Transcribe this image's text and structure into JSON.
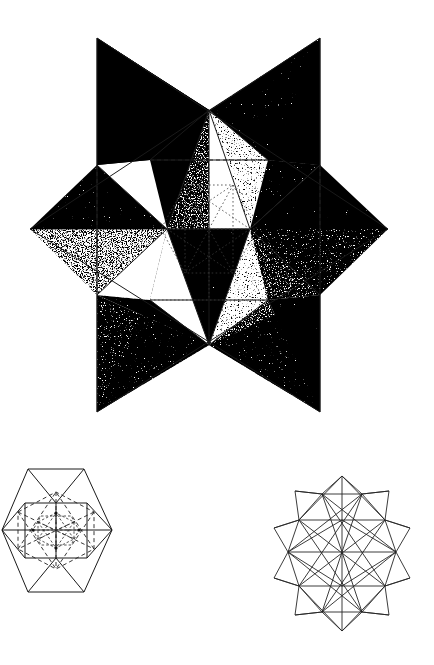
{
  "page": {
    "background_color": "#ffffff",
    "ink_color": "#1a1a1a",
    "width": 434,
    "height": 665,
    "technique": "pen-and-ink stipple shading with ruled construction lines"
  },
  "figures": [
    {
      "id": "fig-main",
      "name": "main-stellated-star",
      "caption": "",
      "description": "Large six-pointed stellated polyhedron rendered in stipple shading",
      "bounds": {
        "x": 0,
        "y": 0,
        "width": 434,
        "height": 440
      },
      "outer_points": [
        {
          "label": "top-left-spike",
          "x": 97,
          "y": 38
        },
        {
          "label": "top-right-spike",
          "x": 320,
          "y": 38
        },
        {
          "label": "right-point",
          "x": 388,
          "y": 229
        },
        {
          "label": "bottom-right-spike",
          "x": 320,
          "y": 412
        },
        {
          "label": "bottom-left-spike",
          "x": 97,
          "y": 412
        },
        {
          "label": "left-point",
          "x": 30,
          "y": 229
        }
      ],
      "inner_vertices": [
        {
          "label": "top-center",
          "x": 209,
          "y": 110
        },
        {
          "label": "left-inner",
          "x": 167,
          "y": 229
        },
        {
          "label": "right-inner",
          "x": 250,
          "y": 229
        },
        {
          "label": "bottom-center",
          "x": 209,
          "y": 345
        },
        {
          "label": "upper-right-inner",
          "x": 268,
          "y": 160
        },
        {
          "label": "upper-left-inner",
          "x": 150,
          "y": 160
        }
      ],
      "shading_tones": [
        {
          "region": "upper-left-face",
          "tone": "light",
          "density": 0.16
        },
        {
          "region": "upper-right-face",
          "tone": "light",
          "density": 0.18
        },
        {
          "region": "upper-center-dark",
          "tone": "very-dark",
          "density": 0.62
        },
        {
          "region": "right-upper-mid",
          "tone": "medium-dark",
          "density": 0.46
        },
        {
          "region": "left-wing-upper",
          "tone": "light",
          "density": 0.17
        },
        {
          "region": "left-wing-lower",
          "tone": "dark",
          "density": 0.52
        },
        {
          "region": "right-wing-upper",
          "tone": "light",
          "density": 0.15
        },
        {
          "region": "right-wing-lower",
          "tone": "medium",
          "density": 0.35
        },
        {
          "region": "center-lower-left",
          "tone": "very-light",
          "density": 0.08
        },
        {
          "region": "center-right-dark",
          "tone": "very-dark",
          "density": 0.66
        },
        {
          "region": "bottom-left-spike-face",
          "tone": "medium",
          "density": 0.4
        },
        {
          "region": "bottom-right-spike-face",
          "tone": "medium-dark",
          "density": 0.45
        },
        {
          "region": "left-void",
          "tone": "white",
          "density": 0.0
        },
        {
          "region": "lower-void",
          "tone": "white",
          "density": 0.0
        }
      ],
      "construction_lines": {
        "vertical_guides": 2,
        "dashed_guides": 4,
        "dotted_interior_hexagon": true
      }
    },
    {
      "id": "fig-hex",
      "name": "hexagonal-projection-diagram",
      "caption": "",
      "description": "Hexagonal outline with nested dashed construction polygons showing the core icosahedron",
      "bounds": {
        "x": 0,
        "y": 440,
        "width": 217,
        "height": 225
      },
      "outer_hexagon": [
        {
          "x": 84,
          "y": 469
        },
        {
          "x": 131,
          "y": 469
        },
        {
          "x": 158,
          "y": 530
        },
        {
          "x": 131,
          "y": 593
        },
        {
          "x": 84,
          "y": 593
        },
        {
          "x": 57,
          "y": 530
        }
      ],
      "line_styles": [
        "solid",
        "dashed",
        "dotted"
      ],
      "nested_levels": 3,
      "has_center_node": true
    },
    {
      "id": "fig-star",
      "name": "small-stellated-polyhedron",
      "caption": "",
      "description": "Small wireframe stellated icosahedron in outline only",
      "bounds": {
        "x": 250,
        "y": 460,
        "width": 184,
        "height": 185
      },
      "spike_count": 12,
      "line_styles": [
        "solid"
      ],
      "filled": false
    }
  ],
  "legend": {
    "solid_line": "visible edge",
    "dashed_line": "hidden edge",
    "dotted_line": "construction line"
  }
}
